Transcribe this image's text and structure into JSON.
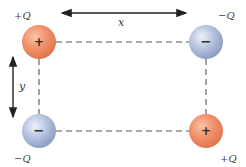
{
  "diagram": {
    "type": "point-charges-rectangle",
    "dimensions": {
      "horizontal_label": "x",
      "vertical_label": "y"
    },
    "charges": [
      {
        "position": "top-left",
        "label": "+Q",
        "sign": "+",
        "color": "#f0906a"
      },
      {
        "position": "top-right",
        "label": "−Q",
        "sign": "−",
        "color": "#a9b9d9"
      },
      {
        "position": "bottom-left",
        "label": "−Q",
        "sign": "−",
        "color": "#a9b9d9"
      },
      {
        "position": "bottom-right",
        "label": "+Q",
        "sign": "+",
        "color": "#f0906a"
      }
    ],
    "colors": {
      "positive": "#f0906a",
      "negative": "#a9b9d9",
      "dashed_line": "#555555",
      "arrow": "#222222"
    }
  }
}
